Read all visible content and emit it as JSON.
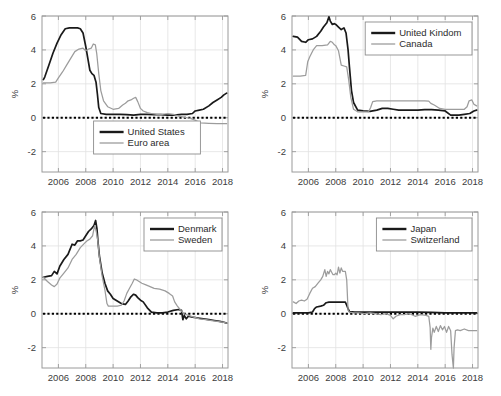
{
  "figure": {
    "width": 501,
    "height": 396,
    "background": "#ffffff",
    "colors": {
      "dark_series": "#1a1a1a",
      "light_series": "#9c9c9c",
      "axis": "#9a9a9a",
      "grid": "#e2e2e2",
      "zero_line": "#000000",
      "text": "#3c3c3c"
    }
  },
  "chart_data": [
    {
      "id": "panel-us-euro",
      "type": "line",
      "title": "",
      "xlabel": "",
      "ylabel": "%",
      "xlim": [
        2004.8,
        2018.4
      ],
      "ylim": [
        -3.2,
        6.0
      ],
      "xticks": [
        2006,
        2008,
        2010,
        2012,
        2014,
        2016,
        2018
      ],
      "yticks": [
        -2,
        0,
        2,
        4,
        6
      ],
      "grid": true,
      "legend_position": "bottom-center",
      "zero_reference_line": 0,
      "series": [
        {
          "name": "United States",
          "style": "dark",
          "x": [
            2004.9,
            2005.0,
            2005.3,
            2005.6,
            2005.9,
            2006.2,
            2006.5,
            2006.8,
            2007.0,
            2007.4,
            2007.6,
            2007.8,
            2008.0,
            2008.15,
            2008.3,
            2008.45,
            2008.6,
            2008.75,
            2008.85,
            2008.95,
            2009.1,
            2009.5,
            2010.0,
            2010.5,
            2011.0,
            2011.5,
            2012.0,
            2012.5,
            2013.0,
            2013.5,
            2014.0,
            2014.5,
            2015.0,
            2015.4,
            2015.8,
            2016.0,
            2016.3,
            2016.6,
            2017.0,
            2017.3,
            2017.6,
            2017.9,
            2018.1,
            2018.3
          ],
          "y": [
            2.25,
            2.4,
            3.1,
            3.8,
            4.4,
            4.9,
            5.25,
            5.3,
            5.3,
            5.3,
            5.25,
            5.0,
            4.2,
            3.5,
            2.8,
            2.6,
            2.5,
            2.1,
            1.4,
            0.6,
            0.25,
            0.2,
            0.2,
            0.2,
            0.18,
            0.15,
            0.2,
            0.2,
            0.18,
            0.18,
            0.15,
            0.15,
            0.2,
            0.2,
            0.25,
            0.4,
            0.45,
            0.5,
            0.7,
            0.9,
            1.05,
            1.2,
            1.35,
            1.45
          ]
        },
        {
          "name": "Euro area",
          "style": "light",
          "x": [
            2004.9,
            2005.4,
            2005.8,
            2006.0,
            2006.3,
            2006.6,
            2006.9,
            2007.2,
            2007.5,
            2007.8,
            2008.0,
            2008.2,
            2008.4,
            2008.55,
            2008.7,
            2008.8,
            2008.95,
            2009.1,
            2009.3,
            2009.6,
            2010.0,
            2010.4,
            2010.7,
            2010.9,
            2011.1,
            2011.3,
            2011.5,
            2011.65,
            2011.8,
            2012.0,
            2012.2,
            2012.5,
            2012.8,
            2013.2,
            2013.6,
            2014.0,
            2014.4,
            2014.8,
            2015.1,
            2015.4,
            2015.7,
            2016.0,
            2016.4,
            2017.0,
            2017.6,
            2018.1,
            2018.3
          ],
          "y": [
            2.05,
            2.05,
            2.1,
            2.35,
            2.7,
            3.1,
            3.5,
            3.9,
            4.05,
            4.1,
            3.95,
            4.05,
            4.1,
            4.35,
            4.3,
            3.8,
            2.6,
            1.6,
            1.0,
            0.65,
            0.5,
            0.55,
            0.75,
            0.85,
            1.0,
            1.05,
            1.15,
            1.2,
            0.95,
            0.55,
            0.4,
            0.3,
            0.25,
            0.2,
            0.2,
            0.25,
            0.2,
            0.1,
            0.05,
            0.0,
            -0.05,
            -0.15,
            -0.3,
            -0.33,
            -0.35,
            -0.35,
            -0.35
          ]
        }
      ]
    },
    {
      "id": "panel-uk-canada",
      "type": "line",
      "title": "",
      "xlabel": "",
      "ylabel": "%",
      "xlim": [
        2004.8,
        2018.4
      ],
      "ylim": [
        -3.2,
        6.0
      ],
      "xticks": [
        2006,
        2008,
        2010,
        2012,
        2014,
        2016,
        2018
      ],
      "yticks": [
        -2,
        0,
        2,
        4,
        6
      ],
      "grid": true,
      "legend_position": "top-right",
      "zero_reference_line": 0,
      "series": [
        {
          "name": "United Kindom",
          "style": "dark",
          "x": [
            2004.9,
            2005.2,
            2005.5,
            2005.8,
            2006.0,
            2006.3,
            2006.6,
            2006.9,
            2007.1,
            2007.35,
            2007.5,
            2007.6,
            2007.75,
            2007.9,
            2008.0,
            2008.2,
            2008.4,
            2008.6,
            2008.75,
            2008.9,
            2009.0,
            2009.15,
            2009.3,
            2009.6,
            2010.0,
            2010.5,
            2011.0,
            2011.4,
            2011.8,
            2012.2,
            2012.6,
            2013.0,
            2013.5,
            2014.0,
            2014.5,
            2015.0,
            2015.5,
            2016.0,
            2016.4,
            2016.7,
            2017.0,
            2017.4,
            2017.8,
            2018.1,
            2018.3
          ],
          "y": [
            4.8,
            4.75,
            4.5,
            4.45,
            4.6,
            4.65,
            4.8,
            5.1,
            5.35,
            5.6,
            5.95,
            5.7,
            5.5,
            5.55,
            5.5,
            5.35,
            5.2,
            5.3,
            5.0,
            4.0,
            3.0,
            1.6,
            0.9,
            0.45,
            0.4,
            0.38,
            0.45,
            0.55,
            0.55,
            0.5,
            0.45,
            0.45,
            0.45,
            0.45,
            0.48,
            0.48,
            0.45,
            0.4,
            0.15,
            0.15,
            0.15,
            0.2,
            0.25,
            0.4,
            0.45
          ]
        },
        {
          "name": "Canada",
          "style": "light",
          "x": [
            2004.9,
            2005.4,
            2005.8,
            2005.95,
            2006.1,
            2006.35,
            2006.6,
            2007.0,
            2007.4,
            2007.6,
            2007.75,
            2007.9,
            2008.0,
            2008.2,
            2008.4,
            2008.6,
            2008.8,
            2008.95,
            2009.1,
            2009.3,
            2009.6,
            2010.0,
            2010.4,
            2010.55,
            2010.7,
            2011.0,
            2011.5,
            2012.0,
            2012.5,
            2013.0,
            2013.5,
            2014.0,
            2014.5,
            2014.8,
            2014.95,
            2015.2,
            2015.6,
            2016.0,
            2016.5,
            2017.0,
            2017.4,
            2017.6,
            2017.75,
            2017.95,
            2018.1,
            2018.3
          ],
          "y": [
            2.45,
            2.45,
            2.5,
            3.3,
            3.6,
            4.0,
            4.25,
            4.25,
            4.3,
            4.5,
            4.45,
            4.3,
            4.25,
            3.95,
            3.1,
            3.05,
            3.0,
            2.2,
            1.2,
            0.5,
            0.35,
            0.35,
            0.35,
            0.6,
            0.95,
            1.0,
            1.0,
            1.0,
            1.0,
            1.0,
            1.0,
            1.0,
            1.0,
            0.98,
            0.85,
            0.75,
            0.55,
            0.5,
            0.5,
            0.5,
            0.5,
            0.65,
            1.0,
            1.05,
            0.8,
            0.7
          ]
        }
      ]
    },
    {
      "id": "panel-denmark-sweden",
      "type": "line",
      "title": "",
      "xlabel": "",
      "ylabel": "%",
      "xlim": [
        2004.8,
        2018.4
      ],
      "ylim": [
        -3.2,
        6.0
      ],
      "xticks": [
        2006,
        2008,
        2010,
        2012,
        2014,
        2016,
        2018
      ],
      "yticks": [
        -2,
        0,
        2,
        4,
        6
      ],
      "grid": true,
      "legend_position": "top-right",
      "zero_reference_line": 0,
      "series": [
        {
          "name": "Denmark",
          "style": "dark",
          "x": [
            2004.9,
            2005.2,
            2005.5,
            2005.7,
            2005.9,
            2006.1,
            2006.4,
            2006.7,
            2007.0,
            2007.2,
            2007.4,
            2007.6,
            2007.8,
            2008.0,
            2008.2,
            2008.4,
            2008.6,
            2008.72,
            2008.82,
            2008.9,
            2009.0,
            2009.2,
            2009.4,
            2009.6,
            2009.8,
            2010.0,
            2010.3,
            2010.6,
            2010.9,
            2011.1,
            2011.3,
            2011.5,
            2011.65,
            2011.8,
            2012.0,
            2012.2,
            2012.5,
            2012.8,
            2013.2,
            2013.6,
            2014.0,
            2014.4,
            2014.8,
            2015.0,
            2015.1,
            2015.2,
            2015.35,
            2015.5,
            2015.8,
            2016.2,
            2016.6,
            2017.0,
            2017.4,
            2017.8,
            2018.1,
            2018.3
          ],
          "y": [
            2.15,
            2.2,
            2.25,
            2.5,
            2.35,
            2.8,
            3.2,
            3.5,
            4.1,
            4.05,
            4.3,
            4.3,
            4.35,
            4.6,
            4.85,
            5.0,
            5.2,
            5.5,
            5.0,
            4.2,
            3.4,
            2.4,
            1.8,
            1.35,
            1.15,
            0.9,
            0.75,
            0.6,
            0.55,
            0.75,
            1.0,
            1.15,
            1.1,
            0.95,
            0.8,
            0.7,
            0.35,
            0.1,
            0.05,
            0.05,
            0.1,
            0.2,
            0.25,
            0.2,
            -0.35,
            -0.1,
            -0.3,
            -0.15,
            -0.2,
            -0.25,
            -0.3,
            -0.35,
            -0.4,
            -0.45,
            -0.5,
            -0.55
          ]
        },
        {
          "name": "Sweden",
          "style": "light",
          "x": [
            2004.9,
            2005.2,
            2005.5,
            2005.7,
            2005.9,
            2006.1,
            2006.4,
            2006.7,
            2007.0,
            2007.3,
            2007.6,
            2007.9,
            2008.1,
            2008.3,
            2008.5,
            2008.65,
            2008.78,
            2008.88,
            2009.0,
            2009.2,
            2009.4,
            2009.55,
            2009.65,
            2009.8,
            2010.0,
            2010.3,
            2010.6,
            2010.8,
            2011.0,
            2011.2,
            2011.4,
            2011.55,
            2011.7,
            2011.9,
            2012.1,
            2012.4,
            2012.7,
            2013.0,
            2013.4,
            2013.8,
            2014.1,
            2014.35,
            2014.5,
            2014.7,
            2014.9,
            2015.0,
            2015.2,
            2015.5,
            2015.9,
            2016.3,
            2016.8,
            2017.2,
            2017.6,
            2018.0,
            2018.3
          ],
          "y": [
            2.15,
            1.9,
            1.7,
            1.6,
            1.75,
            2.1,
            2.4,
            2.7,
            3.2,
            3.5,
            3.9,
            4.15,
            4.3,
            4.4,
            4.6,
            5.2,
            4.8,
            4.3,
            3.3,
            2.2,
            1.4,
            0.6,
            0.45,
            0.45,
            0.45,
            0.45,
            0.5,
            0.75,
            1.2,
            1.5,
            1.8,
            2.05,
            2.0,
            1.9,
            1.8,
            1.7,
            1.6,
            1.5,
            1.45,
            1.35,
            1.2,
            1.05,
            0.7,
            0.45,
            0.25,
            0.15,
            0.0,
            -0.1,
            -0.2,
            -0.3,
            -0.35,
            -0.4,
            -0.45,
            -0.5,
            -0.55
          ]
        }
      ]
    },
    {
      "id": "panel-japan-switzerland",
      "type": "line",
      "title": "",
      "xlabel": "",
      "ylabel": "%",
      "xlim": [
        2004.8,
        2018.4
      ],
      "ylim": [
        -3.2,
        6.0
      ],
      "xticks": [
        2006,
        2008,
        2010,
        2012,
        2014,
        2016,
        2018
      ],
      "yticks": [
        -2,
        0,
        2,
        4,
        6
      ],
      "grid": true,
      "legend_position": "top-right",
      "zero_reference_line": 0,
      "series": [
        {
          "name": "Japan",
          "style": "dark",
          "x": [
            2004.9,
            2005.5,
            2006.0,
            2006.3,
            2006.45,
            2006.6,
            2006.9,
            2007.1,
            2007.3,
            2007.5,
            2008.0,
            2008.4,
            2008.7,
            2008.8,
            2008.9,
            2009.0,
            2009.4,
            2010.0,
            2011.0,
            2012.0,
            2013.0,
            2014.0,
            2015.0,
            2016.0,
            2017.0,
            2018.0,
            2018.3
          ],
          "y": [
            0.05,
            0.05,
            0.05,
            0.1,
            0.3,
            0.4,
            0.45,
            0.5,
            0.65,
            0.68,
            0.68,
            0.68,
            0.68,
            0.5,
            0.3,
            0.12,
            0.1,
            0.1,
            0.1,
            0.1,
            0.1,
            0.1,
            0.08,
            0.05,
            0.05,
            0.05,
            0.05
          ]
        },
        {
          "name": "Switzerland",
          "style": "light",
          "x": [
            2004.9,
            2005.1,
            2005.3,
            2005.5,
            2005.7,
            2005.9,
            2006.1,
            2006.3,
            2006.5,
            2006.7,
            2006.9,
            2007.05,
            2007.2,
            2007.3,
            2007.4,
            2007.5,
            2007.6,
            2007.7,
            2007.8,
            2007.9,
            2008.0,
            2008.1,
            2008.2,
            2008.3,
            2008.4,
            2008.5,
            2008.6,
            2008.7,
            2008.8,
            2008.9,
            2009.0,
            2009.3,
            2009.7,
            2010.1,
            2010.5,
            2010.9,
            2011.3,
            2011.7,
            2012.0,
            2012.2,
            2012.4,
            2012.7,
            2013.0,
            2013.4,
            2013.8,
            2014.2,
            2014.6,
            2014.8,
            2014.9,
            2014.95,
            2015.0,
            2015.1,
            2015.2,
            2015.35,
            2015.5,
            2015.65,
            2015.8,
            2015.95,
            2016.1,
            2016.25,
            2016.4,
            2016.5,
            2016.6,
            2016.65,
            2016.75,
            2016.9,
            2017.1,
            2017.4,
            2017.7,
            2018.0,
            2018.3
          ],
          "y": [
            0.7,
            0.6,
            0.75,
            0.8,
            0.75,
            0.85,
            1.2,
            1.5,
            1.6,
            1.8,
            2.0,
            2.2,
            2.6,
            2.2,
            2.5,
            2.35,
            2.6,
            2.45,
            2.3,
            2.3,
            2.4,
            2.3,
            2.75,
            2.4,
            2.7,
            2.5,
            2.5,
            2.5,
            2.0,
            0.2,
            0.1,
            0.05,
            0.05,
            0.0,
            0.05,
            0.0,
            -0.05,
            0.0,
            -0.1,
            -0.3,
            -0.15,
            -0.05,
            -0.05,
            0.0,
            -0.15,
            -0.05,
            -0.1,
            -0.15,
            -0.8,
            -2.1,
            -1.4,
            -0.85,
            -1.1,
            -0.75,
            -1.05,
            -0.7,
            -0.95,
            -0.75,
            -1.1,
            -0.75,
            -1.0,
            -2.4,
            -3.2,
            -2.0,
            -1.0,
            -0.95,
            -1.0,
            -0.9,
            -1.0,
            -1.0,
            -1.0
          ]
        }
      ]
    }
  ]
}
